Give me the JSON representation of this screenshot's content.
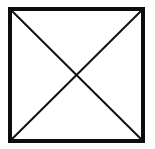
{
  "figure": {
    "name": "square-with-diagonals",
    "canvas": {
      "width": 155,
      "height": 149,
      "background_color": "#ffffff"
    },
    "square": {
      "label": "square-outline",
      "x": 10,
      "y": 9,
      "width": 133,
      "height": 132,
      "stroke_color": "#0d0d0d",
      "stroke_width": 4,
      "fill_color": "#ffffff"
    },
    "diagonals": [
      {
        "label": "diagonal-top-left-to-bottom-right",
        "x1": 12,
        "y1": 11,
        "x2": 141,
        "y2": 139,
        "stroke_color": "#111111",
        "stroke_width": 2
      },
      {
        "label": "diagonal-top-right-to-bottom-left",
        "x1": 141,
        "y1": 11,
        "x2": 12,
        "y2": 139,
        "stroke_color": "#111111",
        "stroke_width": 2
      }
    ],
    "intersection": {
      "label": "diagonal-crossing-point",
      "x": 77,
      "y": 75
    }
  }
}
